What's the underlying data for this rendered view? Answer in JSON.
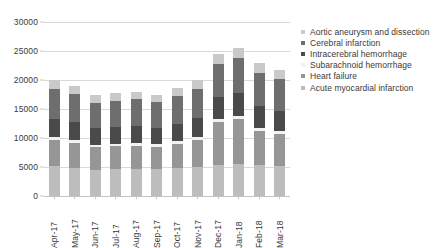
{
  "chart_data": {
    "type": "bar",
    "stacked": true,
    "title": "",
    "xlabel": "",
    "ylabel": "",
    "ylim": [
      0,
      30000
    ],
    "ytick_step": 5000,
    "ytick_labels": [
      "30000",
      "25000",
      "20000",
      "15000",
      "10000",
      "5000",
      "0"
    ],
    "ytick_values": [
      30000,
      25000,
      20000,
      15000,
      10000,
      5000,
      0
    ],
    "grid": true,
    "legend_position": "right",
    "categories": [
      "Apr-17",
      "May-17",
      "Jun-17",
      "Jul-17",
      "Aug-17",
      "Sep-17",
      "Oct-17",
      "Nov-17",
      "Dec-17",
      "Jan-18",
      "Feb-18",
      "Mar-18"
    ],
    "series": [
      {
        "name": "Acute myocardial infarction",
        "color": "#bdbdbd",
        "values": [
          5100,
          4900,
          4500,
          4600,
          4700,
          4600,
          4800,
          5000,
          5400,
          5600,
          5300,
          5200
        ]
      },
      {
        "name": "Heart failure",
        "color": "#969696",
        "values": [
          4500,
          4300,
          3900,
          4000,
          4000,
          3900,
          4200,
          4600,
          7400,
          7600,
          5900,
          5500
        ]
      },
      {
        "name": "Subarachnoid hemorrhage",
        "color": "#f2f2f2",
        "values": [
          500,
          500,
          450,
          450,
          450,
          450,
          480,
          500,
          550,
          600,
          550,
          520
        ]
      },
      {
        "name": "Intracerebral hemorrhage",
        "color": "#4a4a4a",
        "values": [
          3200,
          3000,
          2800,
          2800,
          2900,
          2800,
          3000,
          3300,
          3700,
          3900,
          3700,
          3500
        ]
      },
      {
        "name": "Cerebral infarction",
        "color": "#6e6e6e",
        "values": [
          5200,
          4900,
          4450,
          4550,
          4650,
          4450,
          4820,
          5100,
          5750,
          6050,
          5750,
          5480
        ]
      },
      {
        "name": "Aortic aneurysm and dissection",
        "color": "#c9c9c9",
        "values": [
          1500,
          1400,
          1300,
          1300,
          1300,
          1300,
          1400,
          1500,
          1700,
          1800,
          1700,
          1600
        ]
      }
    ],
    "totals": [
      20000,
      19000,
      17400,
      17700,
      18000,
      17500,
      18700,
      20000,
      24500,
      25550,
      22900,
      21800
    ],
    "legend_entries": [
      {
        "label": "Aortic aneurysm and dissection",
        "color": "#c9c9c9"
      },
      {
        "label": "Cerebral infarction",
        "color": "#6e6e6e"
      },
      {
        "label": "Intracerebral hemorrhage",
        "color": "#4a4a4a"
      },
      {
        "label": "Subarachnoid hemorrhage",
        "color": "#f2f2f2"
      },
      {
        "label": "Heart failure",
        "color": "#969696"
      },
      {
        "label": "Acute myocardial infarction",
        "color": "#bdbdbd"
      }
    ]
  }
}
